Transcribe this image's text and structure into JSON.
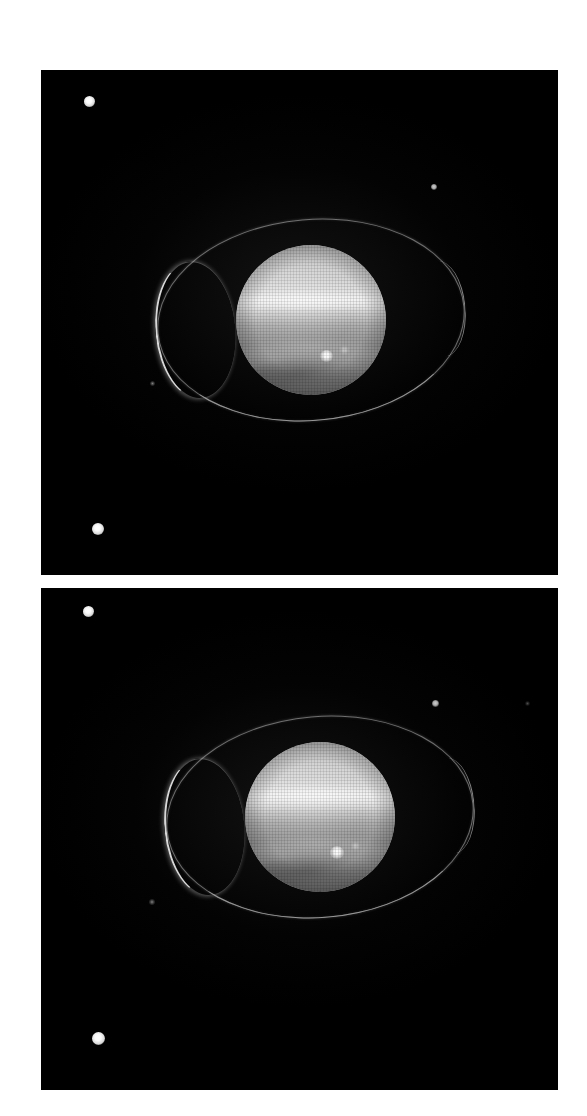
{
  "figure": {
    "width": 587,
    "height": 1116,
    "background_color": "#ffffff",
    "layout": "two stacked image panels",
    "panel_count": 2
  },
  "panels": [
    {
      "id": "panel-top",
      "label": "upper-frame",
      "x": 41,
      "y": 70,
      "width": 517,
      "height": 505,
      "background_color": "#000000",
      "planet": {
        "name": "ringed-planet-disk",
        "center_x": 311,
        "center_y": 320,
        "diameter": 150,
        "body_color": "#bfbfbf",
        "features": [
          "bright north polar haze",
          "bright equatorial band",
          "darker mid latitudes",
          "south banding",
          "bright storm spot"
        ],
        "bright_spot": {
          "x": 332,
          "y": 388,
          "size": 13
        },
        "secondary_spot": {
          "x": 352,
          "y": 384,
          "size": 8
        }
      },
      "ring": {
        "name": "planetary-ring-ellipse",
        "center_x": 311,
        "center_y": 320,
        "semi_major": 154,
        "semi_minor": 101,
        "tilt_deg": -5,
        "color": "#c4c4c4",
        "brightest_side": "left ansa"
      },
      "moons": [
        {
          "label": "moon-upper-left",
          "x": 89,
          "y": 101,
          "size": 11,
          "brightness": "bright"
        },
        {
          "label": "moon-right",
          "x": 434,
          "y": 187,
          "size": 6,
          "brightness": "dim"
        },
        {
          "label": "moon-mid-left",
          "x": 152,
          "y": 383,
          "size": 5,
          "brightness": "faint"
        },
        {
          "label": "moon-lower-left",
          "x": 98,
          "y": 529,
          "size": 12,
          "brightness": "bright"
        }
      ]
    },
    {
      "id": "panel-bottom",
      "label": "lower-frame",
      "x": 41,
      "y": 588,
      "width": 517,
      "height": 502,
      "background_color": "#000000",
      "planet": {
        "name": "ringed-planet-disk",
        "center_x": 320,
        "center_y": 817,
        "diameter": 150,
        "body_color": "#bfbfbf",
        "features": [
          "bright north polar haze",
          "bright equatorial band",
          "darker mid latitudes",
          "south banding",
          "bright storm spot"
        ],
        "bright_spot": {
          "x": 335,
          "y": 891,
          "size": 13
        },
        "secondary_spot": {
          "x": 355,
          "y": 887,
          "size": 8
        }
      },
      "ring": {
        "name": "planetary-ring-ellipse",
        "center_x": 320,
        "center_y": 817,
        "semi_major": 154,
        "semi_minor": 101,
        "tilt_deg": -5,
        "color": "#c4c4c4",
        "brightest_side": "left ansa"
      },
      "moons": [
        {
          "label": "moon-upper-left",
          "x": 88,
          "y": 611,
          "size": 11,
          "brightness": "bright"
        },
        {
          "label": "moon-right",
          "x": 435,
          "y": 703,
          "size": 7,
          "brightness": "dim"
        },
        {
          "label": "moon-far-right",
          "x": 527,
          "y": 703,
          "size": 5,
          "brightness": "vfaint"
        },
        {
          "label": "moon-mid-left",
          "x": 152,
          "y": 902,
          "size": 6,
          "brightness": "faint"
        },
        {
          "label": "moon-lower-left",
          "x": 98,
          "y": 1038,
          "size": 13,
          "brightness": "bright"
        }
      ]
    }
  ]
}
